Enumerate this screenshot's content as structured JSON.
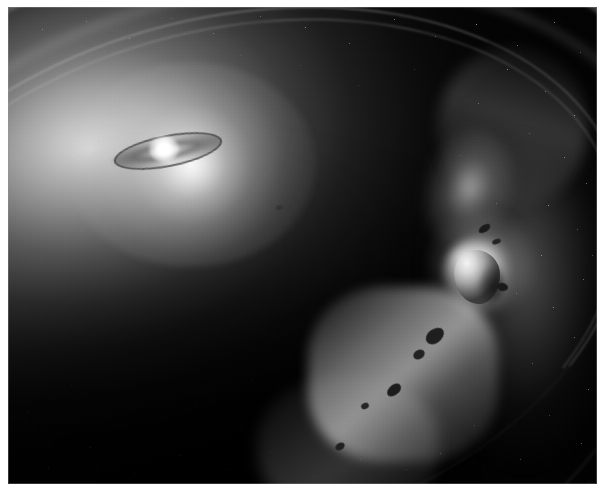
{
  "image": {
    "title": "Circumstellar debris disk with embedded moonlet",
    "alt_text": "Grayscale astronomical illustration of a tilted circumstellar disk lit by a bright central star, with concentric ring bands, a bright outer ring arc, and an embedded moonlet surrounded by dark rocky fragments",
    "rendering_style": "grayscale artist concept",
    "orientation": "oblique / tilted viewing angle"
  },
  "scene": {
    "background_label": "deep space star field",
    "background_color": "#040404",
    "highlight_color": "#ffffff",
    "midtone_color": "#8a8a8a",
    "shadow_color": "#111111"
  },
  "objects": {
    "central_star": {
      "name": "central star",
      "description": "bright white stellar source at upper left of the disk"
    },
    "inner_ringlet": {
      "name": "inner dark ringlet",
      "description": "narrow dark ring seen nearly edge-on encircling the central star"
    },
    "main_disk": {
      "name": "main debris disk",
      "description": "broad luminous disk fading from bright near the star to dark at the near edge"
    },
    "ring_bands": [
      {
        "name": "outer halo arc"
      },
      {
        "name": "outer bright arc"
      },
      {
        "name": "disk outer rim"
      },
      {
        "name": "inner gap edge (outer line)"
      },
      {
        "name": "inner gap edge (inner line)"
      },
      {
        "name": "mid-disk density band"
      },
      {
        "name": "near-side faint arc"
      },
      {
        "name": "near-side outer faint arc"
      }
    ],
    "outer_arc": {
      "name": "bright outer ring arc",
      "description": "luminous tapering arc running from upper right down toward the lower center"
    },
    "moonlet": {
      "name": "embedded moonlet",
      "description": "bright irregular body embedded within the outer ring arc, casting a shadow"
    },
    "fragments": {
      "name": "rocky fragments",
      "description": "dark irregular planetesimals strung along the bright arc",
      "count": 9
    }
  },
  "stars": [
    {
      "x": 34,
      "y": 22,
      "s": 1.1,
      "o": 0.7
    },
    {
      "x": 78,
      "y": 14,
      "s": 1.0,
      "o": 0.55
    },
    {
      "x": 121,
      "y": 31,
      "s": 1.3,
      "o": 0.8
    },
    {
      "x": 163,
      "y": 11,
      "s": 0.9,
      "o": 0.48
    },
    {
      "x": 205,
      "y": 26,
      "s": 1.1,
      "o": 0.62
    },
    {
      "x": 252,
      "y": 9,
      "s": 1.0,
      "o": 0.52
    },
    {
      "x": 297,
      "y": 20,
      "s": 1.4,
      "o": 0.84
    },
    {
      "x": 341,
      "y": 36,
      "s": 1.0,
      "o": 0.58
    },
    {
      "x": 386,
      "y": 12,
      "s": 1.2,
      "o": 0.7
    },
    {
      "x": 427,
      "y": 29,
      "s": 0.9,
      "o": 0.5
    },
    {
      "x": 468,
      "y": 17,
      "s": 1.3,
      "o": 0.76
    },
    {
      "x": 509,
      "y": 38,
      "s": 1.0,
      "o": 0.55
    },
    {
      "x": 546,
      "y": 15,
      "s": 1.1,
      "o": 0.64
    },
    {
      "x": 572,
      "y": 45,
      "s": 0.9,
      "o": 0.47
    },
    {
      "x": 499,
      "y": 62,
      "s": 1.2,
      "o": 0.68
    },
    {
      "x": 537,
      "y": 84,
      "s": 1.0,
      "o": 0.54
    },
    {
      "x": 566,
      "y": 108,
      "s": 1.3,
      "o": 0.74
    },
    {
      "x": 521,
      "y": 126,
      "s": 0.9,
      "o": 0.45
    },
    {
      "x": 556,
      "y": 150,
      "s": 1.1,
      "o": 0.6
    },
    {
      "x": 578,
      "y": 176,
      "s": 1.0,
      "o": 0.52
    },
    {
      "x": 540,
      "y": 198,
      "s": 1.2,
      "o": 0.66
    },
    {
      "x": 569,
      "y": 222,
      "s": 0.9,
      "o": 0.44
    },
    {
      "x": 533,
      "y": 248,
      "s": 1.1,
      "o": 0.58
    },
    {
      "x": 575,
      "y": 272,
      "s": 1.0,
      "o": 0.5
    },
    {
      "x": 545,
      "y": 300,
      "s": 1.2,
      "o": 0.64
    },
    {
      "x": 508,
      "y": 286,
      "s": 0.9,
      "o": 0.42
    },
    {
      "x": 566,
      "y": 330,
      "s": 1.1,
      "o": 0.56
    },
    {
      "x": 524,
      "y": 356,
      "s": 1.0,
      "o": 0.48
    },
    {
      "x": 580,
      "y": 382,
      "s": 1.2,
      "o": 0.62
    },
    {
      "x": 541,
      "y": 408,
      "s": 0.9,
      "o": 0.44
    },
    {
      "x": 573,
      "y": 436,
      "s": 1.1,
      "o": 0.55
    },
    {
      "x": 512,
      "y": 452,
      "s": 1.0,
      "o": 0.47
    },
    {
      "x": 466,
      "y": 418,
      "s": 0.9,
      "o": 0.4
    },
    {
      "x": 432,
      "y": 446,
      "s": 1.0,
      "o": 0.44
    },
    {
      "x": 398,
      "y": 462,
      "s": 0.9,
      "o": 0.38
    },
    {
      "x": 352,
      "y": 452,
      "s": 1.0,
      "o": 0.42
    },
    {
      "x": 306,
      "y": 468,
      "s": 0.9,
      "o": 0.36
    },
    {
      "x": 262,
      "y": 444,
      "s": 1.0,
      "o": 0.4
    },
    {
      "x": 218,
      "y": 462,
      "s": 0.9,
      "o": 0.34
    },
    {
      "x": 172,
      "y": 448,
      "s": 1.0,
      "o": 0.38
    },
    {
      "x": 126,
      "y": 466,
      "s": 0.9,
      "o": 0.32
    },
    {
      "x": 82,
      "y": 440,
      "s": 1.0,
      "o": 0.36
    },
    {
      "x": 40,
      "y": 460,
      "s": 0.9,
      "o": 0.3
    },
    {
      "x": 20,
      "y": 404,
      "s": 0.9,
      "o": 0.3
    },
    {
      "x": 63,
      "y": 378,
      "s": 0.8,
      "o": 0.26
    },
    {
      "x": 188,
      "y": 396,
      "s": 0.8,
      "o": 0.26
    },
    {
      "x": 244,
      "y": 372,
      "s": 0.8,
      "o": 0.24
    },
    {
      "x": 330,
      "y": 398,
      "s": 0.8,
      "o": 0.26
    },
    {
      "x": 420,
      "y": 352,
      "s": 0.9,
      "o": 0.34
    },
    {
      "x": 488,
      "y": 196,
      "s": 0.9,
      "o": 0.4
    },
    {
      "x": 452,
      "y": 148,
      "s": 0.8,
      "o": 0.32
    },
    {
      "x": 470,
      "y": 96,
      "s": 1.0,
      "o": 0.44
    },
    {
      "x": 406,
      "y": 62,
      "s": 0.9,
      "o": 0.34
    },
    {
      "x": 350,
      "y": 78,
      "s": 0.8,
      "o": 0.26
    },
    {
      "x": 292,
      "y": 58,
      "s": 0.8,
      "o": 0.24
    },
    {
      "x": 232,
      "y": 48,
      "s": 0.8,
      "o": 0.22
    },
    {
      "x": 150,
      "y": 62,
      "s": 0.8,
      "o": 0.2
    },
    {
      "x": 96,
      "y": 44,
      "s": 0.9,
      "o": 0.28
    },
    {
      "x": 590,
      "y": 62,
      "s": 1.0,
      "o": 0.5
    },
    {
      "x": 584,
      "y": 248,
      "s": 0.9,
      "o": 0.42
    }
  ],
  "credit": {
    "text": ""
  }
}
